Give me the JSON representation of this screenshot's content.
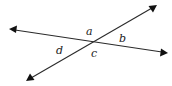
{
  "diagram": {
    "type": "intersecting-lines",
    "colors": {
      "line": "#2a2a2a",
      "arrowhead": "#111111",
      "label": "#222222",
      "background": "#ffffff"
    },
    "lines": [
      {
        "id": "line-1",
        "from": [
          9,
          29
        ],
        "to": [
          168,
          53
        ],
        "arrows": "both"
      },
      {
        "id": "line-2",
        "from": [
          26,
          81
        ],
        "to": [
          157,
          5
        ],
        "arrows": "both"
      }
    ],
    "intersection": [
      92,
      42
    ],
    "angle_labels": [
      {
        "text": "a",
        "x": 86,
        "y": 35
      },
      {
        "text": "b",
        "x": 119,
        "y": 42
      },
      {
        "text": "c",
        "x": 91,
        "y": 57
      },
      {
        "text": "d",
        "x": 56,
        "y": 54
      }
    ]
  }
}
